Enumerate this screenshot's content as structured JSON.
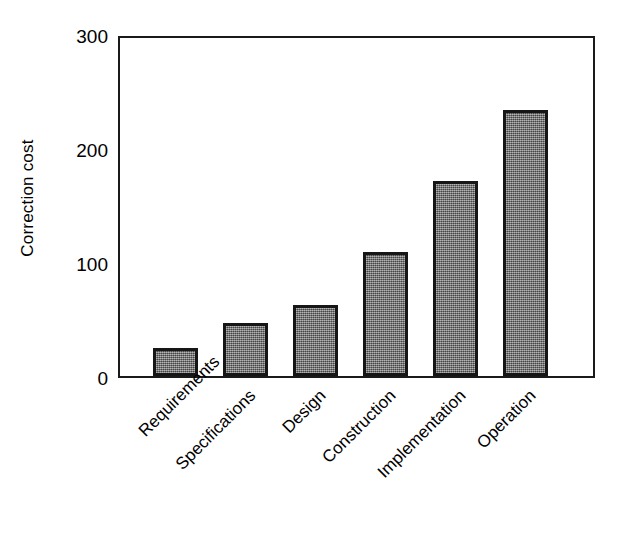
{
  "chart_data": {
    "type": "bar",
    "title": "",
    "xlabel": "",
    "ylabel": "Correction cost",
    "ylim": [
      0,
      300
    ],
    "yticks": [
      0,
      100,
      200,
      300
    ],
    "ytick_labels": [
      "0",
      "100",
      "200",
      "300"
    ],
    "grid": false,
    "legend": false,
    "categories": [
      "Requirements",
      "Specifications",
      "Design",
      "Construction",
      "Implementation",
      "Operation"
    ],
    "values": [
      25,
      47,
      63,
      110,
      173,
      236
    ],
    "bar_fill_color": "#6e6e6e",
    "bar_edge_color": "#161616",
    "axis_color": "#1a1a1a",
    "background_color": "#ffffff",
    "xtick_label_rotation": -45
  }
}
